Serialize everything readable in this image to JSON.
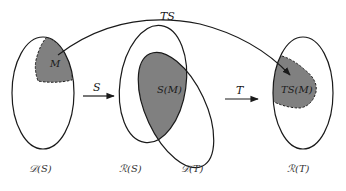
{
  "diagram": {
    "type": "set-mapping",
    "colors": {
      "stroke": "#1a1a1a",
      "shaded_fill": "#808080",
      "background": "#ffffff"
    },
    "sets": {
      "domain_S": {
        "label": "𝒟(S)"
      },
      "range_S": {
        "label": "ℛ(S)"
      },
      "domain_T": {
        "label": "𝒟(T)"
      },
      "range_T": {
        "label": "ℛ(T)"
      }
    },
    "regions": {
      "M": {
        "label": "M"
      },
      "SM": {
        "label": "S(M)"
      },
      "TSM": {
        "label": "TS(M)"
      }
    },
    "arrows": {
      "S": {
        "label": "S"
      },
      "T": {
        "label": "T"
      },
      "TS": {
        "label": "TS"
      }
    }
  }
}
